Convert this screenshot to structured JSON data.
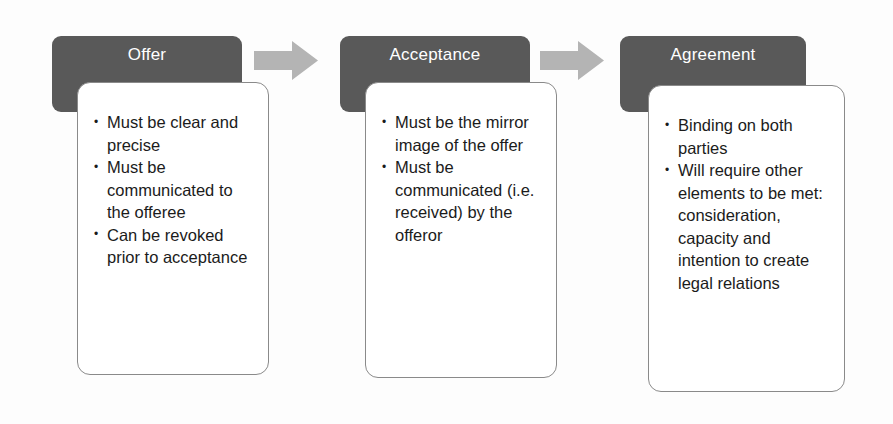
{
  "diagram": {
    "colors": {
      "header_fill": "#595959",
      "header_text": "#ffffff",
      "card_fill": "#ffffff",
      "card_border": "#8a8a8a",
      "arrow_fill": "#b4b4b4",
      "body_text": "#1b1b1b",
      "background": "#fdfdfd"
    },
    "stages": [
      {
        "id": "offer",
        "header": "Offer",
        "bullets": [
          "Must be clear and precise",
          "Must be communicated to the offeree",
          "Can be revoked prior to acceptance"
        ]
      },
      {
        "id": "acceptance",
        "header": "Acceptance",
        "bullets": [
          "Must be the mirror image of the offer",
          "Must be communicated (i.e. received) by the offeror"
        ]
      },
      {
        "id": "agreement",
        "header": "Agreement",
        "bullets": [
          "Binding on both parties",
          "Will require other elements to be met: consideration, capacity and intention to create legal relations"
        ]
      }
    ],
    "connectors": [
      {
        "id": "arrow-offer-to-acceptance",
        "icon": "right-arrow-icon"
      },
      {
        "id": "arrow-acceptance-to-agreement",
        "icon": "right-arrow-icon"
      }
    ]
  }
}
